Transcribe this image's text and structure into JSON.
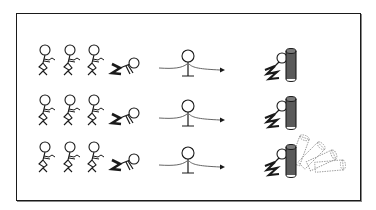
{
  "figure": {
    "colors": {
      "line": "#1a1a1a",
      "cylinder": "#555555",
      "ghost": "#9a9a9a",
      "background": "#ffffff"
    },
    "rows": [
      {
        "y": 62,
        "group_count": 3,
        "falling_cylinders": 0
      },
      {
        "y": 113,
        "group_count": 3,
        "falling_cylinders": 0
      },
      {
        "y": 160,
        "group_count": 3,
        "falling_cylinders": 4
      }
    ]
  }
}
